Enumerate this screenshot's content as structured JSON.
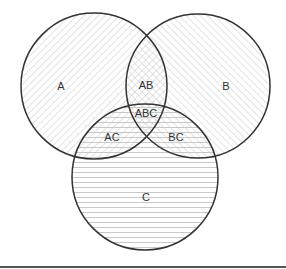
{
  "diagram": {
    "type": "venn",
    "sets": 3,
    "colors": {
      "stroke": "#333333",
      "hatch": "#c8c8c8",
      "background": "#ffffff",
      "bottom_rule": "#555555"
    },
    "circles": [
      {
        "id": "A",
        "cx": 94,
        "cy": 86,
        "r": 73,
        "pattern": "diagonal-right"
      },
      {
        "id": "B",
        "cx": 198,
        "cy": 86,
        "r": 72,
        "pattern": "diagonal-left"
      },
      {
        "id": "C",
        "cx": 145,
        "cy": 177,
        "r": 73,
        "pattern": "horizontal"
      }
    ],
    "labels": {
      "A": "A",
      "B": "B",
      "C": "C",
      "AB": "AB",
      "AC": "AC",
      "BC": "BC",
      "ABC": "ABC"
    }
  }
}
